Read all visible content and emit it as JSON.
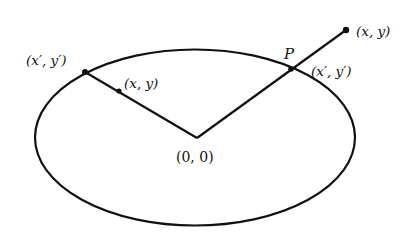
{
  "diagram": {
    "type": "geometry",
    "colors": {
      "stroke": "#111111",
      "background": "#ffffff"
    },
    "ellipse": {
      "cx": 195,
      "cy": 137.5,
      "rx": 160,
      "ry": 88
    },
    "origin": {
      "x": 197,
      "y": 138,
      "label": "(0, 0)"
    },
    "left_ray": {
      "boundary_point": {
        "x": 85,
        "y": 72,
        "label": "(x′, y′)"
      },
      "inner_point": {
        "x": 119,
        "y": 91,
        "label": "(x, y)"
      }
    },
    "right_ray": {
      "boundary_point": {
        "x": 291,
        "y": 69,
        "label": "(x′, y′)",
        "name_label": "P"
      },
      "outer_point": {
        "x": 346,
        "y": 30,
        "label": "(x, y)"
      }
    }
  }
}
